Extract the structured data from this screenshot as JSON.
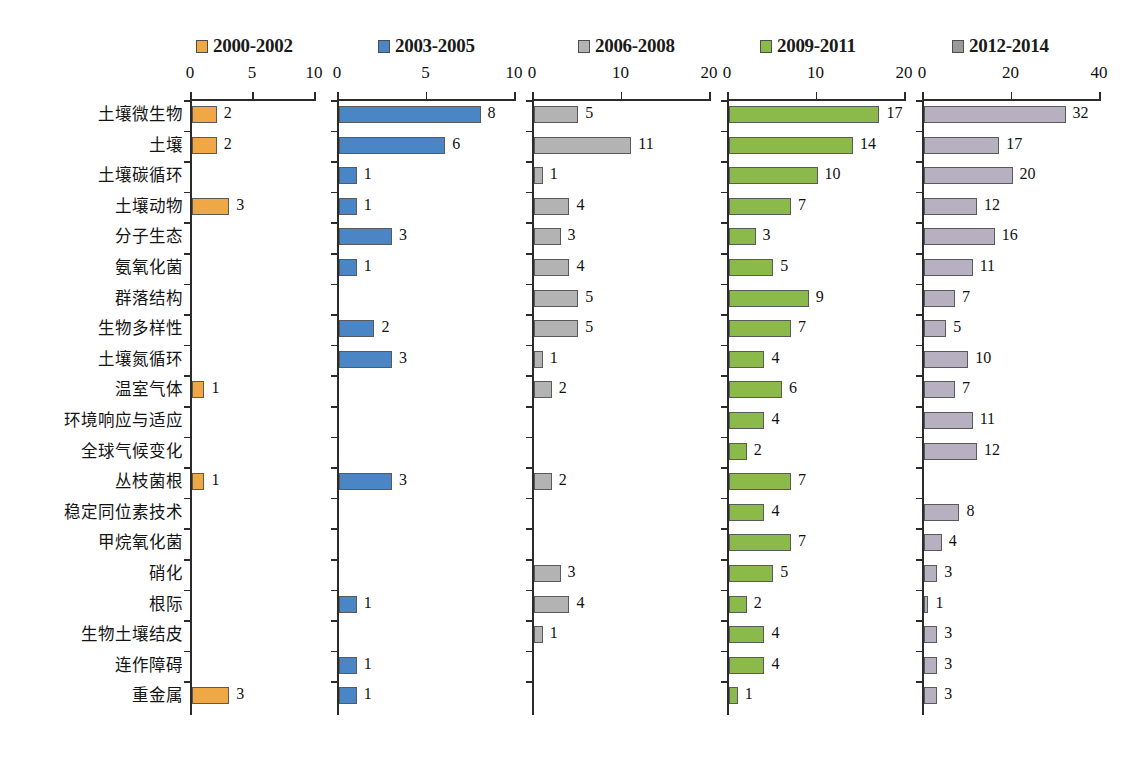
{
  "chart_data": {
    "type": "bar",
    "title": "",
    "orientation": "horizontal",
    "layout": "small-multiples: 5 side-by-side horizontal bar panels sharing one category axis",
    "grid": false,
    "legend_position": "top",
    "categories": [
      "土壤微生物",
      "土壤",
      "土壤碳循环",
      "土壤动物",
      "分子生态",
      "氨氧化菌",
      "群落结构",
      "生物多样性",
      "土壤氮循环",
      "温室气体",
      "环境响应与适应",
      "全球气候变化",
      "丛枝菌根",
      "稳定同位素技术",
      "甲烷氧化菌",
      "硝化",
      "根际",
      "生物土壤结皮",
      "连作障碍",
      "重金属"
    ],
    "series": [
      {
        "name": "2000-2002",
        "color": "#f0a845",
        "xlim": [
          0,
          10
        ],
        "xticks": [
          0,
          5,
          10
        ],
        "values": [
          2,
          2,
          0,
          3,
          0,
          0,
          0,
          0,
          0,
          1,
          0,
          0,
          1,
          0,
          0,
          0,
          0,
          0,
          0,
          3
        ]
      },
      {
        "name": "2003-2005",
        "color": "#4a86c5",
        "xlim": [
          0,
          10
        ],
        "xticks": [
          0,
          5,
          10
        ],
        "values": [
          8,
          6,
          1,
          1,
          3,
          1,
          0,
          2,
          3,
          0,
          0,
          0,
          3,
          0,
          0,
          0,
          1,
          0,
          1,
          1
        ]
      },
      {
        "name": "2006-2008",
        "color": "#b3b3b3",
        "xlim": [
          0,
          20
        ],
        "xticks": [
          0,
          10,
          20
        ],
        "values": [
          5,
          11,
          1,
          4,
          3,
          4,
          5,
          5,
          1,
          2,
          0,
          0,
          2,
          0,
          0,
          3,
          4,
          1,
          0,
          0
        ]
      },
      {
        "name": "2009-2011",
        "color": "#8cba4a",
        "xlim": [
          0,
          20
        ],
        "xticks": [
          0,
          10,
          20
        ],
        "values": [
          17,
          14,
          10,
          7,
          3,
          5,
          9,
          7,
          4,
          6,
          4,
          2,
          7,
          4,
          7,
          5,
          2,
          4,
          4,
          1
        ]
      },
      {
        "name": "2012-2014",
        "color": "#b6b0c0",
        "legend_color": "#9a9a9a",
        "xlim": [
          0,
          40
        ],
        "xticks": [
          0,
          20,
          40
        ],
        "values": [
          32,
          17,
          20,
          12,
          16,
          11,
          7,
          5,
          10,
          7,
          11,
          12,
          0,
          8,
          4,
          3,
          1,
          3,
          3,
          3
        ]
      }
    ],
    "xlabel": "",
    "ylabel": ""
  },
  "legend": {
    "items": [
      {
        "label": "2000-2002",
        "color": "#f0a845"
      },
      {
        "label": "2003-2005",
        "color": "#4a86c5"
      },
      {
        "label": "2006-2008",
        "color": "#b3b3b3"
      },
      {
        "label": "2009-2011",
        "color": "#8cba4a"
      },
      {
        "label": "2012-2014",
        "color": "#9a9a9a"
      }
    ]
  },
  "caption": ""
}
